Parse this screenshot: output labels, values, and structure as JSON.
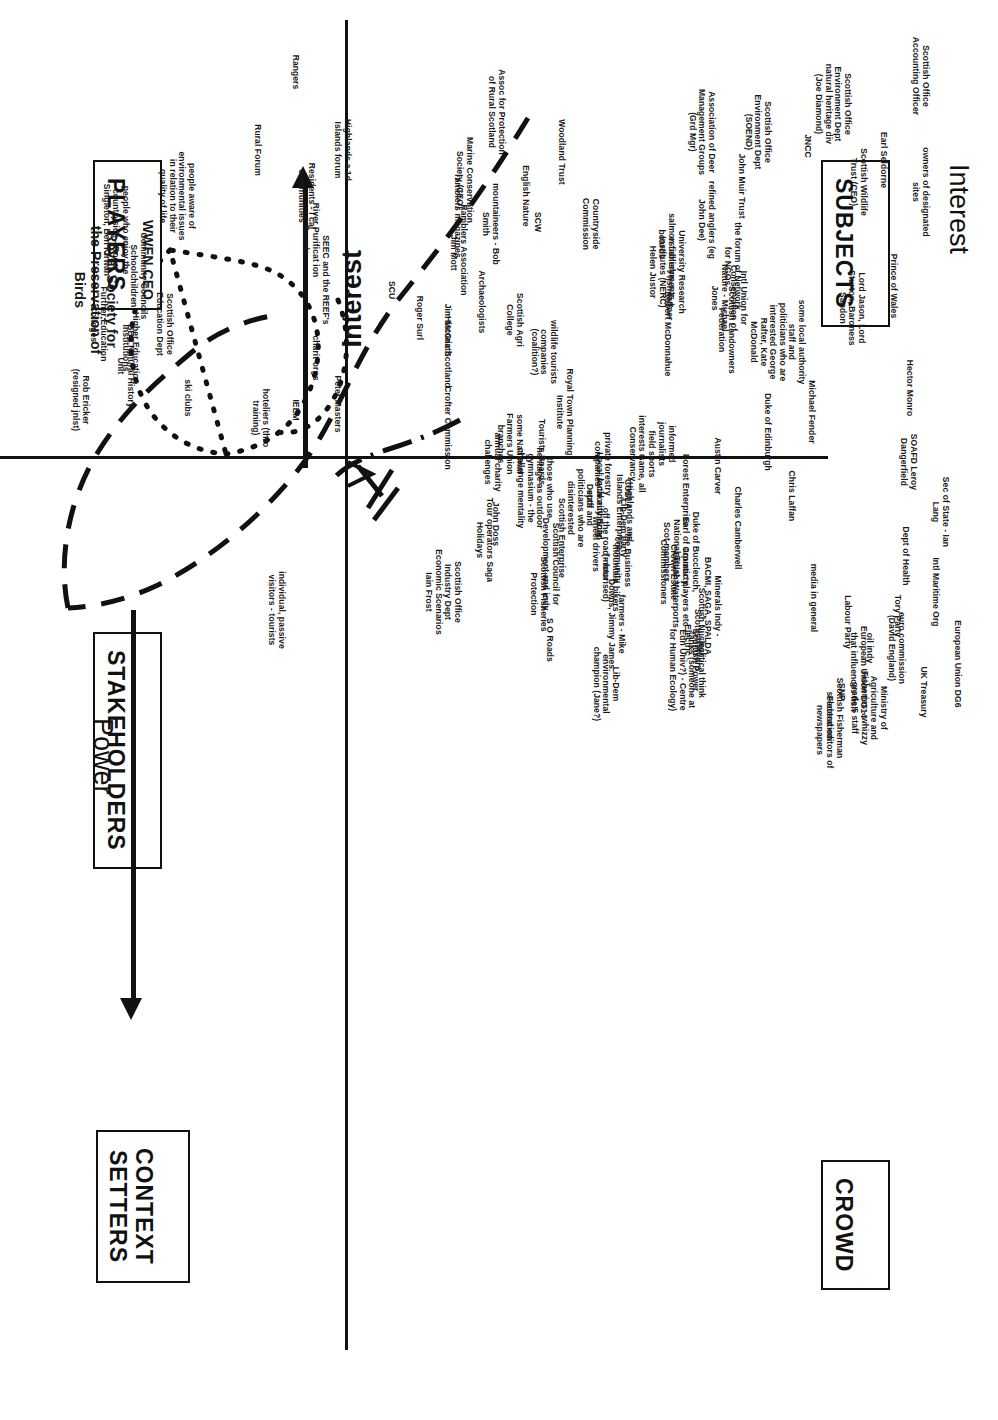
{
  "axes": {
    "x_axis_label": "Power",
    "y_axis_label_top": "Interest",
    "y_axis_label_inner": "Interest"
  },
  "quadrant_boxes": [
    {
      "name": "subjects",
      "label": "SUBJECTS"
    },
    {
      "name": "players",
      "label": "PLAYERS"
    },
    {
      "name": "crowd",
      "label": "CROWD"
    },
    {
      "name": "context-setters",
      "label": "CONTEXT\nSETTERS"
    }
  ],
  "quadrant_headings": [
    {
      "name": "stakeholders",
      "label": "STAKEHOLDERS"
    }
  ],
  "highlight": {
    "organisation": "Royal Society for\nthe Preservation of\nBirds",
    "role": "WWFN CEO"
  },
  "chart_data": {
    "type": "scatter",
    "xlabel": "Power",
    "ylabel": "Interest",
    "grid": false,
    "legend": "none",
    "quadrants": [
      "SUBJECTS",
      "PLAYERS",
      "CROWD",
      "CONTEXT SETTERS"
    ],
    "points": [
      {
        "label": "Rangers",
        "x": 72,
        "y": 300
      },
      {
        "label": "Highlands a 1d\nIslands forum",
        "x": 150,
        "y": 352
      },
      {
        "label": "Rural Forum",
        "x": 150,
        "y": 262
      },
      {
        "label": "Residents - l cal\ncommunities",
        "x": 196,
        "y": 316
      },
      {
        "label": "people aware of\nenvironmental issues\nin relation to their\nquality of life",
        "x": 196,
        "y": 196
      },
      {
        "label": "people who enjoy the\ncountryside - Roger\nSingleton, Ben Kirwan",
        "x": 230,
        "y": 130
      },
      {
        "label": "River Purificat ion\nBoards",
        "x": 240,
        "y": 320
      },
      {
        "label": "SEEC and the REEF's",
        "x": 280,
        "y": 330
      },
      {
        "label": "SCU",
        "x": 290,
        "y": 396
      },
      {
        "label": "Community Councils\nSchoolchildren",
        "x": 276,
        "y": 148
      },
      {
        "label": "Further Education\nColleges",
        "x": 324,
        "y": 108
      },
      {
        "label": "Scottish Office\nEducation Dept",
        "x": 324,
        "y": 174
      },
      {
        "label": "Higher Education\nInstitutions",
        "x": 348,
        "y": 140
      },
      {
        "label": "BBC Natural History\nUnit",
        "x": 366,
        "y": 135
      },
      {
        "label": "charit orgs",
        "x": 358,
        "y": 320
      },
      {
        "label": "Rob Ericker\n(resigned jnlst)",
        "x": 400,
        "y": 90
      },
      {
        "label": "ski clubs",
        "x": 398,
        "y": 192
      },
      {
        "label": "hoteliers (thro\ntraining)",
        "x": 418,
        "y": 270
      },
      {
        "label": "IEEM",
        "x": 410,
        "y": 300
      },
      {
        "label": "Peter Masters",
        "x": 404,
        "y": 342
      },
      {
        "label": "Assoc for Protection\nof Rural Scotland",
        "x": 112,
        "y": 506
      },
      {
        "label": "Marine Conservation\nSociety (CEO)",
        "x": 180,
        "y": 474
      },
      {
        "label": "Woodland Trust",
        "x": 152,
        "y": 566
      },
      {
        "label": "English Nature",
        "x": 196,
        "y": 530
      },
      {
        "label": "SCW",
        "x": 222,
        "y": 542
      },
      {
        "label": "Countryside\nCommission",
        "x": 224,
        "y": 600
      },
      {
        "label": "ramblers magazines",
        "x": 216,
        "y": 462
      },
      {
        "label": "mountaineers - Bob\nSmith",
        "x": 224,
        "y": 500
      },
      {
        "label": "Ramblers Association\n- Jim Mott",
        "x": 250,
        "y": 468
      },
      {
        "label": "Archaeologists",
        "x": 302,
        "y": 486
      },
      {
        "label": "Scottish Agri\nCollege",
        "x": 320,
        "y": 524
      },
      {
        "label": "Jim McGrath",
        "x": 330,
        "y": 452
      },
      {
        "label": "Roger Surl",
        "x": 318,
        "y": 424
      },
      {
        "label": "Historic Scotland",
        "x": 352,
        "y": 452
      },
      {
        "label": "wildlife tourists\ncompanies\n(coalition?)",
        "x": 352,
        "y": 558
      },
      {
        "label": "Royal Town Planning\nInstitute",
        "x": 412,
        "y": 574
      },
      {
        "label": "Crofter Commission",
        "x": 428,
        "y": 452
      },
      {
        "label": "some National\nFarmers Union\nbranches",
        "x": 444,
        "y": 524
      },
      {
        "label": "Tourists Boards",
        "x": 452,
        "y": 546
      },
      {
        "label": "annual charity\nchallenges",
        "x": 462,
        "y": 502
      },
      {
        "label": "private forestry\ncompanies",
        "x": 464,
        "y": 612
      },
      {
        "label": "field sports\ninterests Game, all\nConservancy",
        "x": 454,
        "y": 656
      },
      {
        "label": "informed\njournalists",
        "x": 444,
        "y": 676
      },
      {
        "label": "COSLA",
        "x": 494,
        "y": 632
      },
      {
        "label": "those who use\nheritage as outdoor\ngymnasium - the\nchallenge mentality",
        "x": 488,
        "y": 554
      },
      {
        "label": "Local Authority Road\nDepts",
        "x": 496,
        "y": 604
      },
      {
        "label": "John Doss",
        "x": 524,
        "y": 500
      },
      {
        "label": "Tour operators Saga\nHolidays",
        "x": 540,
        "y": 494
      },
      {
        "label": "Scottish Office\nIndustry Dept\nEconomic Scenarios\nIain Frost",
        "x": 592,
        "y": 462
      },
      {
        "label": "individual, passive\nvisitors - tourists",
        "x": 610,
        "y": 286
      },
      {
        "label": "Association of Deer\nManagement Groups\n(Grd Mgr)",
        "x": 132,
        "y": 716
      },
      {
        "label": "Scottish Office\nEnvironment Dept\n(SOEND)",
        "x": 132,
        "y": 772
      },
      {
        "label": "JNCC",
        "x": 146,
        "y": 812
      },
      {
        "label": "Scottish Office\nEnvironment Dept\nnatural heritage div\n(Joe Diamond)",
        "x": 104,
        "y": 852
      },
      {
        "label": "Scottish Office\nAccounting Officer",
        "x": 76,
        "y": 930
      },
      {
        "label": "John Muir Trust",
        "x": 186,
        "y": 746
      },
      {
        "label": "refined anglers (eg\nJohn Dee)",
        "x": 220,
        "y": 716
      },
      {
        "label": "salmon fishery\nboards",
        "x": 244,
        "y": 676
      },
      {
        "label": "University Research\nestablishments +\nInstitutes (NERC)\nHelen Justor",
        "x": 272,
        "y": 686
      },
      {
        "label": "fish farmer",
        "x": 298,
        "y": 674
      },
      {
        "label": "Robert McDonnahue",
        "x": 334,
        "y": 672
      },
      {
        "label": "Earl Seldorne",
        "x": 160,
        "y": 888
      },
      {
        "label": "Scottish Wildlife\nTrust (CEO)",
        "x": 182,
        "y": 868
      },
      {
        "label": "the forum of Network\nfor NGOs",
        "x": 266,
        "y": 742
      },
      {
        "label": "Intl Union for\nConservation of\nNature - Michael\nJones",
        "x": 298,
        "y": 748
      },
      {
        "label": "Scottish Landowners\nFederation",
        "x": 330,
        "y": 736
      },
      {
        "label": "some local authority\nstaff and\npoliticians who are\ninterested George\nRafter, Kate\nMcDonald",
        "x": 342,
        "y": 806
      },
      {
        "label": "owners of designated\nsites",
        "x": 192,
        "y": 930
      },
      {
        "label": "Prince of Wales",
        "x": 286,
        "y": 898
      },
      {
        "label": "Lord Jason, Lord\nSturton, Baroness\nSandon",
        "x": 308,
        "y": 866
      },
      {
        "label": "Michael Fender",
        "x": 412,
        "y": 816
      },
      {
        "label": "Duke of Edinburgh",
        "x": 432,
        "y": 772
      },
      {
        "label": "Hector Monro",
        "x": 388,
        "y": 914
      },
      {
        "label": "Austin Carver",
        "x": 466,
        "y": 722
      },
      {
        "label": "SOAFD Leroy\nDangerfield",
        "x": 462,
        "y": 918
      },
      {
        "label": "Forest Enterprise",
        "x": 490,
        "y": 690
      },
      {
        "label": "Chris Laffan",
        "x": 496,
        "y": 796
      },
      {
        "label": "Sec of State - Ian\nLang",
        "x": 512,
        "y": 950
      },
      {
        "label": "Dept of Health",
        "x": 556,
        "y": 910
      },
      {
        "label": "Charles Camberwell",
        "x": 528,
        "y": 742
      },
      {
        "label": "Duke of Buccleuch,\nEarl of Cromarty,\nNational Trust +\nScot members",
        "x": 552,
        "y": 700
      },
      {
        "label": "Crown Estate\nCommissioners",
        "x": 572,
        "y": 678
      },
      {
        "label": "Highlands and\nIslands Enterprise",
        "x": 512,
        "y": 634
      },
      {
        "label": "Lib-Dem party",
        "x": 528,
        "y": 628
      },
      {
        "label": "local authority\nstaff and\npoliticians who are\ndisinterested",
        "x": 508,
        "y": 604
      },
      {
        "label": "Scottish Enterprise",
        "x": 538,
        "y": 566
      },
      {
        "label": "off the road - four\nwheel drivers",
        "x": 544,
        "y": 610
      },
      {
        "label": "the Business\ncommunity",
        "x": 560,
        "y": 632
      },
      {
        "label": "Scottish Council for\nDevelopment and indy",
        "x": 564,
        "y": 560
      },
      {
        "label": "mountain bikers\n(motorised)",
        "x": 578,
        "y": 620
      },
      {
        "label": "Scottish Fisheries\nProtection",
        "x": 594,
        "y": 548
      },
      {
        "label": "aquatic players etc -\nBritish Waterports",
        "x": 590,
        "y": 690
      },
      {
        "label": "Minerals Indy -\nBACMI, SAGA, SPALDA",
        "x": 606,
        "y": 722
      },
      {
        "label": "Scottish Nuclear",
        "x": 622,
        "y": 706
      },
      {
        "label": "farmers - Mike\nDowns, Jimmy James",
        "x": 624,
        "y": 626
      },
      {
        "label": "S O Roads",
        "x": 640,
        "y": 554
      },
      {
        "label": "Scottish Hydro\nElectric",
        "x": 640,
        "y": 702
      },
      {
        "label": "Scottish Power",
        "x": 660,
        "y": 700
      },
      {
        "label": "political think\ntanks (someone at\nEdn Univ?) - Centre\nfor Human Ecology)",
        "x": 670,
        "y": 706
      },
      {
        "label": "Lib-Dem\nenvironmental\nchampion (Jane?)",
        "x": 684,
        "y": 620
      },
      {
        "label": "media in general",
        "x": 598,
        "y": 818
      },
      {
        "label": "Labour Party",
        "x": 622,
        "y": 852
      },
      {
        "label": "Tory Party",
        "x": 616,
        "y": 902
      },
      {
        "label": "Intl Maritime Org",
        "x": 592,
        "y": 940
      },
      {
        "label": "oil indy",
        "x": 648,
        "y": 874
      },
      {
        "label": "euro commission\n(David England)",
        "x": 648,
        "y": 906
      },
      {
        "label": "European Union DG14\nthat influences fish",
        "x": 672,
        "y": 868
      },
      {
        "label": "European Union DG6",
        "x": 664,
        "y": 962
      },
      {
        "label": "UK Treasury",
        "x": 692,
        "y": 928
      },
      {
        "label": "SNP",
        "x": 692,
        "y": 846
      },
      {
        "label": "Ministry of\nAgriculture and\nFisheries - whizzy\ngrade 5 staff",
        "x": 708,
        "y": 888
      },
      {
        "label": "Scottish Fisherman\nFederation",
        "x": 718,
        "y": 844
      },
      {
        "label": "selected editors of\nnewspapers",
        "x": 730,
        "y": 834
      }
    ]
  }
}
